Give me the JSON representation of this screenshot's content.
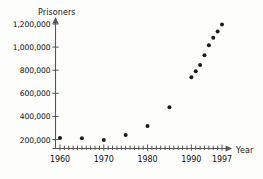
{
  "chart_data": {
    "type": "scatter",
    "title": "",
    "xlabel": "Year",
    "ylabel": "Prisoners",
    "xlim": [
      1958.5,
      1998.5
    ],
    "ylim": [
      100000,
      1260000
    ],
    "grid": false,
    "legend": null,
    "y_ticks": [
      200000,
      400000,
      600000,
      800000,
      1000000,
      1200000
    ],
    "y_tick_labels": [
      "200,000",
      "400,000",
      "600,000",
      "800,000",
      "1,000,000",
      "1,200,000"
    ],
    "x_ticks": [
      1960,
      1970,
      1980,
      1990,
      1997
    ],
    "x_tick_labels": [
      "1960",
      "1970",
      "1980",
      "1990",
      "1997"
    ],
    "x_minor_tick_step": 1,
    "marker": "filled-circle",
    "marker_color": "#1b1b1b",
    "axis_color": "#555555",
    "x": [
      1960,
      1965,
      1970,
      1975,
      1980,
      1985,
      1990,
      1991,
      1992,
      1993,
      1994,
      1995,
      1996,
      1997
    ],
    "y": [
      212000,
      210000,
      196000,
      240000,
      316000,
      480000,
      740000,
      790000,
      845000,
      930000,
      1015000,
      1080000,
      1135000,
      1195000
    ],
    "series": [
      {
        "name": "Prisoners",
        "points": [
          {
            "x": 1960,
            "y": 212000
          },
          {
            "x": 1965,
            "y": 210000
          },
          {
            "x": 1970,
            "y": 196000
          },
          {
            "x": 1975,
            "y": 240000
          },
          {
            "x": 1980,
            "y": 316000
          },
          {
            "x": 1985,
            "y": 480000
          },
          {
            "x": 1990,
            "y": 740000
          },
          {
            "x": 1991,
            "y": 790000
          },
          {
            "x": 1992,
            "y": 845000
          },
          {
            "x": 1993,
            "y": 930000
          },
          {
            "x": 1994,
            "y": 1015000
          },
          {
            "x": 1995,
            "y": 1080000
          },
          {
            "x": 1996,
            "y": 1135000
          },
          {
            "x": 1997,
            "y": 1195000
          }
        ]
      }
    ]
  },
  "axes": {
    "y_title": "Prisoners",
    "x_title": "Year"
  }
}
